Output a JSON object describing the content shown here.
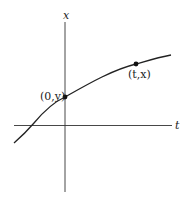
{
  "diagram": {
    "axes": {
      "vertical_label": "x",
      "horizontal_label": "t"
    },
    "points": [
      {
        "label": "(0,y)",
        "position": "on vertical axis"
      },
      {
        "label": "(t,x)",
        "position": "on curve, right"
      }
    ],
    "colors": {
      "stroke": "#222222",
      "background": "#ffffff"
    }
  }
}
